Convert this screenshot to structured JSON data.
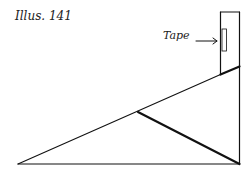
{
  "figure": {
    "title": "Illus. 141",
    "labels": {
      "tape": "Tape"
    }
  }
}
